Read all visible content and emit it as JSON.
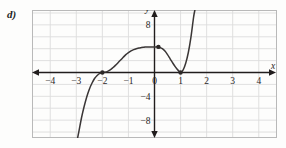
{
  "figure": {
    "part_label": "d)",
    "background_color": "#fdfdfc",
    "frame_color": "#b9b9b9",
    "grid_color": "#dcdcdc",
    "axis_color": "#211d1d",
    "curve_color": "#3a3636",
    "point_color": "#2b2727"
  },
  "chart_data": {
    "type": "line",
    "title": "",
    "subtitle": "",
    "xlabel": "x",
    "ylabel": "y",
    "xlim": [
      -4.7,
      4.7
    ],
    "ylim": [
      -11.0,
      10.5
    ],
    "grid": true,
    "legend": null,
    "x_ticks": [
      -4,
      -3,
      -2,
      -1,
      0,
      1,
      2,
      3,
      4
    ],
    "x_tick_labels": [
      "-4",
      "-3",
      "-2",
      "-1",
      "0",
      "1",
      "2",
      "3",
      "4"
    ],
    "y_ticks": [
      -8,
      -4,
      8
    ],
    "y_tick_labels": [
      "-8",
      "-4",
      "8"
    ],
    "x_grid_step": 1,
    "y_grid_step": 2,
    "series": [
      {
        "name": "y = (x+2)^2 (x-1)",
        "comment": "quartic-like curve; flat (tangent) touch at x=-2 and x=1, local max near x=0.15",
        "x": [
          -2.95,
          -2.9,
          -2.8,
          -2.7,
          -2.6,
          -2.5,
          -2.4,
          -2.3,
          -2.2,
          -2.1,
          -2.0,
          -1.9,
          -1.8,
          -1.7,
          -1.6,
          -1.5,
          -1.4,
          -1.3,
          -1.2,
          -1.1,
          -1.0,
          -0.9,
          -0.8,
          -0.7,
          -0.6,
          -0.5,
          -0.4,
          -0.3,
          -0.2,
          -0.1,
          0.0,
          0.15,
          0.3,
          0.4,
          0.5,
          0.6,
          0.7,
          0.8,
          0.9,
          1.0,
          1.1,
          1.2,
          1.3,
          1.4,
          1.5,
          1.55
        ],
        "y": [
          -11.0,
          -9.9,
          -7.6,
          -5.7,
          -4.1,
          -2.8,
          -1.8,
          -1.0,
          -0.5,
          -0.15,
          0.0,
          0.05,
          0.2,
          0.45,
          0.8,
          1.2,
          1.65,
          2.1,
          2.55,
          3.0,
          3.35,
          3.65,
          3.85,
          4.0,
          4.1,
          4.2,
          4.25,
          4.3,
          4.3,
          4.3,
          4.28,
          4.3,
          4.0,
          3.6,
          3.0,
          2.3,
          1.6,
          0.95,
          0.4,
          0.0,
          0.45,
          1.6,
          3.4,
          6.0,
          9.3,
          10.5
        ]
      }
    ],
    "marked_points": [
      {
        "label": "",
        "x": -2,
        "y": 0,
        "style": "filled-dot"
      },
      {
        "label": "",
        "x": 0.15,
        "y": 4.3,
        "style": "filled-dot"
      },
      {
        "label": "",
        "x": 1,
        "y": 0,
        "style": "filled-dot"
      }
    ],
    "annotations": [
      {
        "text": "y",
        "x": 0,
        "y": 10.2,
        "role": "y-axis-name"
      },
      {
        "text": "x",
        "x": 4.55,
        "y": 0.55,
        "role": "x-axis-name"
      }
    ]
  }
}
